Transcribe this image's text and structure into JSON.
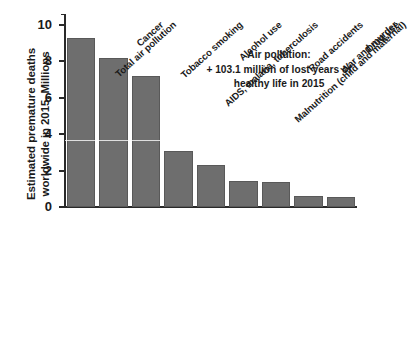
{
  "chart_data": {
    "type": "bar",
    "title": "",
    "xlabel": "",
    "ylabel_lines": [
      "Estimated premature deaths",
      "worldwide in 2015, Millions"
    ],
    "ylabel": "Estimated premature deaths worldwide in 2015, Millions",
    "ylim": [
      0,
      10.6
    ],
    "yticks": [
      0,
      2,
      4,
      6,
      8,
      10
    ],
    "ytick_labels": [
      "0",
      "2",
      "4",
      "6",
      "8",
      "10"
    ],
    "grid": false,
    "legend": null,
    "categories": [
      "Total air pollution",
      "Cancer",
      "Tobacco smoking",
      "AIDS, malaria, tuberculosis",
      "Alcohol use",
      "Malnutrition (child and maternal)",
      "Road accidents",
      "War and murder",
      "Drug use"
    ],
    "values": [
      9.3,
      8.2,
      7.2,
      3.1,
      2.3,
      1.45,
      1.35,
      0.62,
      0.55
    ],
    "bar_color": "#6e6e6e",
    "bar_edge_color": "#595959",
    "axis_color": "#2a2a2a",
    "annotations": [
      {
        "lines": [
          "Air pollution:",
          "+ 103.1 million of lost years of",
          "healthy life in 2015"
        ]
      }
    ]
  }
}
